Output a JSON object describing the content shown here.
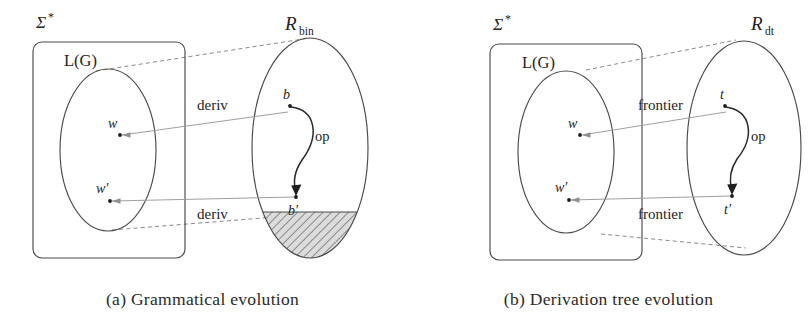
{
  "figure": {
    "panels": [
      {
        "id": "a",
        "caption": "(a) Grammatical evolution",
        "universe_label": "Σ",
        "universe_superscript": "*",
        "language_label": "L(G)",
        "search_space_label": "R",
        "search_space_subscript": "bin",
        "genotype_points": [
          {
            "name": "source-genotype",
            "label": "b"
          },
          {
            "name": "offspring-genotype",
            "label": "b′"
          }
        ],
        "phenotype_points": [
          {
            "name": "source-phenotype",
            "label": "w"
          },
          {
            "name": "offspring-phenotype",
            "label": "w′"
          }
        ],
        "mapping_labels": [
          "deriv",
          "deriv"
        ],
        "operator_label": "op",
        "invalid_region": {
          "name": "invalid-region",
          "hatched": true,
          "hatch_color": "#6b6b6b",
          "fill_color": "#d9d9d9"
        }
      },
      {
        "id": "b",
        "caption": "(b) Derivation tree evolution",
        "universe_label": "Σ",
        "universe_superscript": "*",
        "language_label": "L(G)",
        "search_space_label": "R",
        "search_space_subscript": "dt",
        "genotype_points": [
          {
            "name": "source-tree",
            "label": "t"
          },
          {
            "name": "offspring-tree",
            "label": "t′"
          }
        ],
        "phenotype_points": [
          {
            "name": "source-phenotype",
            "label": "w"
          },
          {
            "name": "offspring-phenotype",
            "label": "w′"
          }
        ],
        "mapping_labels": [
          "frontier",
          "frontier"
        ],
        "operator_label": "op",
        "invalid_region": {
          "name": "invalid-region",
          "hatched": false,
          "hatch_color": "#6b6b6b",
          "fill_color": "#d9d9d9"
        }
      }
    ],
    "colors": {
      "background": "#ffffff",
      "outline": "#4a4a4a",
      "dashed": "#8a8a8a",
      "map_arrow": "#9a9a9a",
      "op_arrow": "#2a2a2a",
      "text": "#242424"
    }
  }
}
